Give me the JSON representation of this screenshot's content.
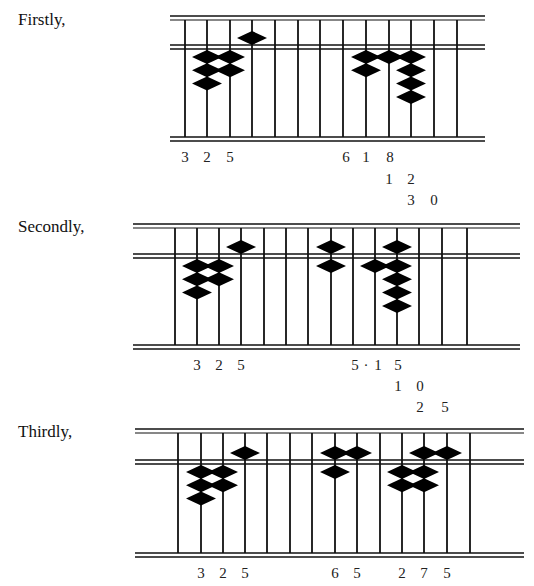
{
  "steps": [
    {
      "label": "Firstly,",
      "label_pos": [
        18,
        10
      ],
      "frame": {
        "x1": 170,
        "x2": 485,
        "top": 16,
        "beam": 45,
        "bottom": 137
      },
      "rods": [
        185,
        207,
        230,
        252,
        275,
        298,
        320,
        343,
        366,
        389,
        411,
        434,
        457
      ],
      "beads": [
        {
          "rod": 1,
          "upper": 0,
          "lower": 3
        },
        {
          "rod": 2,
          "upper": 0,
          "lower": 2
        },
        {
          "rod": 3,
          "upper": 1,
          "lower": 0
        },
        {
          "rod": 8,
          "upper": 0,
          "lower": 2
        },
        {
          "rod": 9,
          "upper": 0,
          "lower": 1
        },
        {
          "rod": 10,
          "upper": 0,
          "lower": 4
        }
      ],
      "number_rows": [
        {
          "y": 162,
          "items": [
            {
              "x": 185,
              "t": "3"
            },
            {
              "x": 207,
              "t": "2"
            },
            {
              "x": 230,
              "t": "5"
            },
            {
              "x": 346,
              "t": "6"
            },
            {
              "x": 366,
              "t": "1"
            },
            {
              "x": 390,
              "t": "8"
            }
          ]
        },
        {
          "y": 184,
          "items": [
            {
              "x": 389,
              "t": "1"
            },
            {
              "x": 411,
              "t": "2"
            }
          ]
        },
        {
          "y": 205,
          "items": [
            {
              "x": 411,
              "t": "3"
            },
            {
              "x": 434,
              "t": "0"
            }
          ]
        }
      ]
    },
    {
      "label": "Secondly,",
      "label_pos": [
        18,
        217
      ],
      "frame": {
        "x1": 133,
        "x2": 520,
        "top": 224,
        "beam": 254,
        "bottom": 345
      },
      "rods": [
        175,
        197,
        219,
        241,
        264,
        286,
        308,
        331,
        353,
        375,
        397,
        419,
        442,
        467
      ],
      "beads": [
        {
          "rod": 1,
          "upper": 0,
          "lower": 3
        },
        {
          "rod": 2,
          "upper": 0,
          "lower": 2
        },
        {
          "rod": 3,
          "upper": 1,
          "lower": 0
        },
        {
          "rod": 7,
          "upper": 1,
          "lower": 1
        },
        {
          "rod": 9,
          "upper": 0,
          "lower": 1
        },
        {
          "rod": 10,
          "upper": 1,
          "lower": 4
        }
      ],
      "number_rows": [
        {
          "y": 370,
          "items": [
            {
              "x": 197,
              "t": "3"
            },
            {
              "x": 219,
              "t": "2"
            },
            {
              "x": 241,
              "t": "5"
            },
            {
              "x": 355,
              "t": "5"
            },
            {
              "x": 366,
              "t": "·"
            },
            {
              "x": 378,
              "t": "1"
            },
            {
              "x": 398,
              "t": "5"
            }
          ]
        },
        {
          "y": 391,
          "items": [
            {
              "x": 398,
              "t": "1"
            },
            {
              "x": 420,
              "t": "0"
            }
          ]
        },
        {
          "y": 412,
          "items": [
            {
              "x": 420,
              "t": "2"
            },
            {
              "x": 445,
              "t": "5"
            }
          ]
        }
      ]
    },
    {
      "label": "Thirdly,",
      "label_pos": [
        18,
        422
      ],
      "frame": {
        "x1": 135,
        "x2": 524,
        "top": 429,
        "beam": 460,
        "bottom": 553
      },
      "rods": [
        178,
        201,
        223,
        245,
        267,
        290,
        312,
        335,
        357,
        380,
        402,
        424,
        447,
        470
      ],
      "beads": [
        {
          "rod": 1,
          "upper": 0,
          "lower": 3
        },
        {
          "rod": 2,
          "upper": 0,
          "lower": 2
        },
        {
          "rod": 3,
          "upper": 1,
          "lower": 0
        },
        {
          "rod": 7,
          "upper": 1,
          "lower": 1
        },
        {
          "rod": 8,
          "upper": 1,
          "lower": 0
        },
        {
          "rod": 10,
          "upper": 0,
          "lower": 2
        },
        {
          "rod": 11,
          "upper": 1,
          "lower": 2
        },
        {
          "rod": 12,
          "upper": 1,
          "lower": 0
        }
      ],
      "number_rows": [
        {
          "y": 578,
          "items": [
            {
              "x": 201,
              "t": "3"
            },
            {
              "x": 223,
              "t": "2"
            },
            {
              "x": 245,
              "t": "5"
            },
            {
              "x": 335,
              "t": "6"
            },
            {
              "x": 357,
              "t": "5"
            },
            {
              "x": 402,
              "t": "2"
            },
            {
              "x": 424,
              "t": "7"
            },
            {
              "x": 447,
              "t": "5"
            }
          ]
        }
      ]
    }
  ]
}
